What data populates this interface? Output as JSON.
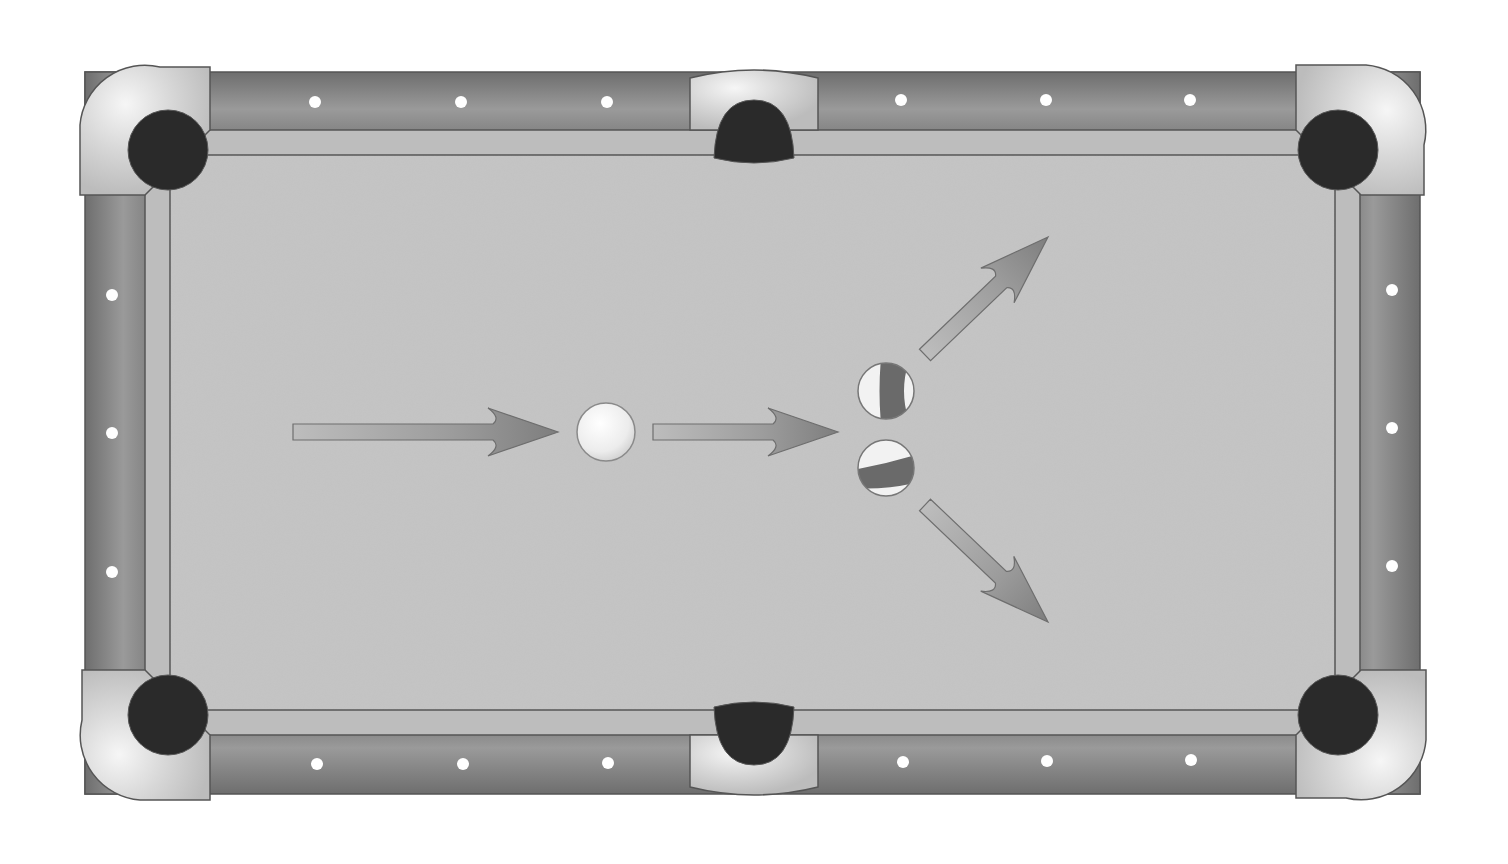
{
  "diagram": {
    "colors": {
      "background": "#ffffff",
      "rail": "#7a7a7a",
      "rail_highlight": "#a0a0a0",
      "cushion": "#bdbdbd",
      "felt": "#c4c4c4",
      "pocket": "#2a2a2a",
      "pocket_cup": "#c8c8c8",
      "pocket_cup_highlight": "#f4f4f4",
      "diamond": "#ffffff",
      "arrow": "#8c8c8c",
      "arrow_shaft": "#b0b0b0",
      "ball_white": "#f2f2f2",
      "ball_stripe": "#6a6a6a",
      "outline": "#555555"
    },
    "table": {
      "rail_outer": {
        "x": 85,
        "y": 72,
        "w": 1335,
        "h": 722
      },
      "felt": {
        "x": 170,
        "y": 155,
        "w": 1165,
        "h": 555
      }
    },
    "pockets": [
      {
        "id": "top-left",
        "cx": 168,
        "cy": 150
      },
      {
        "id": "top-middle",
        "cx": 754,
        "cy": 130
      },
      {
        "id": "top-right",
        "cx": 1338,
        "cy": 150
      },
      {
        "id": "bottom-left",
        "cx": 168,
        "cy": 715
      },
      {
        "id": "bottom-middle",
        "cx": 754,
        "cy": 735
      },
      {
        "id": "bottom-right",
        "cx": 1338,
        "cy": 715
      }
    ],
    "diamonds": [
      {
        "x": 315,
        "y": 102
      },
      {
        "x": 461,
        "y": 102
      },
      {
        "x": 607,
        "y": 102
      },
      {
        "x": 901,
        "y": 100
      },
      {
        "x": 1046,
        "y": 100
      },
      {
        "x": 1190,
        "y": 100
      },
      {
        "x": 317,
        "y": 764
      },
      {
        "x": 463,
        "y": 764
      },
      {
        "x": 608,
        "y": 763
      },
      {
        "x": 903,
        "y": 762
      },
      {
        "x": 1047,
        "y": 761
      },
      {
        "x": 1191,
        "y": 760
      },
      {
        "x": 112,
        "y": 295
      },
      {
        "x": 112,
        "y": 433
      },
      {
        "x": 112,
        "y": 572
      },
      {
        "x": 1392,
        "y": 290
      },
      {
        "x": 1392,
        "y": 428
      },
      {
        "x": 1392,
        "y": 566
      }
    ],
    "balls": [
      {
        "id": "cue-ball",
        "type": "solid",
        "cx": 606,
        "cy": 432,
        "r": 29
      },
      {
        "id": "striped-ball-upper",
        "type": "stripe",
        "cx": 886,
        "cy": 391,
        "r": 28
      },
      {
        "id": "striped-ball-lower",
        "type": "stripe",
        "cx": 886,
        "cy": 468,
        "r": 28
      }
    ],
    "arrows": [
      {
        "id": "cue-approach-arrow",
        "from": [
          293,
          432
        ],
        "to": [
          558,
          432
        ]
      },
      {
        "id": "cue-to-rack-arrow",
        "from": [
          653,
          432
        ],
        "to": [
          838,
          432
        ]
      },
      {
        "id": "upper-ball-deflection-arrow",
        "from": [
          925,
          355
        ],
        "to": [
          1048,
          237
        ]
      },
      {
        "id": "lower-ball-deflection-arrow",
        "from": [
          925,
          505
        ],
        "to": [
          1048,
          622
        ]
      }
    ]
  }
}
